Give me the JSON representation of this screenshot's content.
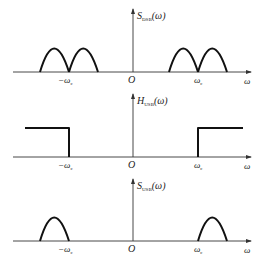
{
  "panels": [
    {
      "id": "s-dsb",
      "ylabel": {
        "base": "S",
        "sub": "DSB",
        "arg": "(ω)"
      },
      "xlabel": "ω",
      "origin": "O",
      "ticks": [
        "−ω",
        "ω"
      ],
      "tick_sub": "c",
      "shape": "double-lobes",
      "description": "DSB spectrum: two adjacent lobes centered on ±ω_c"
    },
    {
      "id": "h-usb",
      "ylabel": {
        "base": "H",
        "sub": "USB",
        "arg": "(ω)"
      },
      "xlabel": "ω",
      "origin": "O",
      "ticks": [
        "−ω",
        "ω"
      ],
      "tick_sub": "c",
      "shape": "highpass",
      "description": "Ideal USB filter: passes |ω| > ω_c"
    },
    {
      "id": "s-usb",
      "ylabel": {
        "base": "S",
        "sub": "USB",
        "arg": "(ω)"
      },
      "xlabel": "ω",
      "origin": "O",
      "ticks": [
        "−ω",
        "ω"
      ],
      "tick_sub": "c",
      "shape": "upper-lobes",
      "description": "USB spectrum: lobes outside ±ω_c only"
    }
  ]
}
